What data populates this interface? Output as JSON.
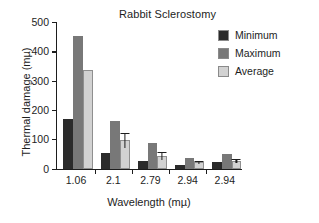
{
  "chart_data": {
    "type": "bar",
    "title": "Rabbit Sclerostomy",
    "xlabel": "Wavelength (mµ)",
    "ylabel": "Thermal damage (mµ)",
    "categories": [
      "1.06",
      "2.1",
      "2.79",
      "2.94",
      "2.94"
    ],
    "ylim": [
      0,
      500
    ],
    "yticks": [
      0,
      100,
      200,
      300,
      400,
      500
    ],
    "ytick_labels": [
      "0",
      "100",
      "200",
      "300",
      "400",
      "500"
    ],
    "grid": false,
    "legend_position": "top-right",
    "series": [
      {
        "name": "Minimum",
        "color": "#2b2b2b",
        "values": [
          170,
          52,
          27,
          14,
          23
        ],
        "errors": [
          null,
          null,
          null,
          null,
          null
        ]
      },
      {
        "name": "Maximum",
        "color": "#787878",
        "values": [
          453,
          164,
          87,
          36,
          50
        ],
        "errors": [
          null,
          null,
          null,
          null,
          null
        ]
      },
      {
        "name": "Average",
        "color": "#d2d2d2",
        "values": [
          338,
          97,
          43,
          22,
          26
        ],
        "errors": [
          null,
          25,
          13,
          5,
          7
        ]
      }
    ]
  },
  "legend": {
    "items": [
      {
        "label": "Minimum",
        "color": "#2b2b2b"
      },
      {
        "label": "Maximum",
        "color": "#787878"
      },
      {
        "label": "Average",
        "color": "#d2d2d2"
      }
    ]
  },
  "axes": {
    "y_tick_labels": [
      "500",
      "400",
      "300",
      "200",
      "100",
      "0"
    ],
    "x_tick_labels": [
      "1.06",
      "2.1",
      "2.79",
      "2.94",
      "2.94"
    ]
  }
}
